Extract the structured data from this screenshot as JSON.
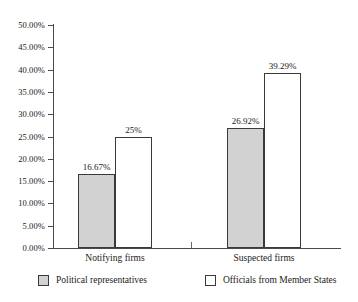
{
  "chart_data": {
    "type": "bar",
    "title": "",
    "subtitle": "",
    "xlabel": "",
    "ylabel": "",
    "categories": [
      "Notifying firms",
      "Suspected firms"
    ],
    "series": [
      {
        "name": "Political representatives",
        "color": "#d2d2d2",
        "values": [
          16.67,
          25.0
        ],
        "labels": [
          "16.67%",
          "26.92%"
        ]
      },
      {
        "name": "Officials from Member States",
        "color": "#ffffff",
        "values": [
          25.0,
          39.29
        ],
        "labels": [
          "25%",
          "39.29%"
        ]
      }
    ],
    "bars": [
      {
        "category": "Notifying firms",
        "series": "Political representatives",
        "value": 16.67,
        "label": "16.67%",
        "fill": "gray"
      },
      {
        "category": "Notifying firms",
        "series": "Officials from Member States",
        "value": 25.0,
        "label": "25%",
        "fill": "white"
      },
      {
        "category": "Suspected firms",
        "series": "Political representatives",
        "value": 26.92,
        "label": "26.92%",
        "fill": "gray"
      },
      {
        "category": "Suspected firms",
        "series": "Officials from Member States",
        "value": 39.29,
        "label": "39.29%",
        "fill": "white"
      }
    ],
    "ylim": [
      0,
      50
    ],
    "ytick_step": 5,
    "ytick_labels": [
      "50.00%",
      "45.00%",
      "40.00%",
      "35.00%",
      "30.00%",
      "25.00%",
      "20.00%",
      "15.00%",
      "10.00%",
      "5.00%",
      "0.00%"
    ],
    "ytick_values": [
      50,
      45,
      40,
      35,
      30,
      25,
      20,
      15,
      10,
      5,
      0
    ],
    "grid": false,
    "legend_position": "bottom",
    "axis_color": "#4a4a4a",
    "bar_outline_color": "#3a3a3a"
  },
  "legend": {
    "entries": [
      {
        "label": "Political representatives",
        "fill": "gray"
      },
      {
        "label": "Officials from Member States",
        "fill": "white"
      }
    ]
  },
  "caption": {
    "remnant": ""
  }
}
